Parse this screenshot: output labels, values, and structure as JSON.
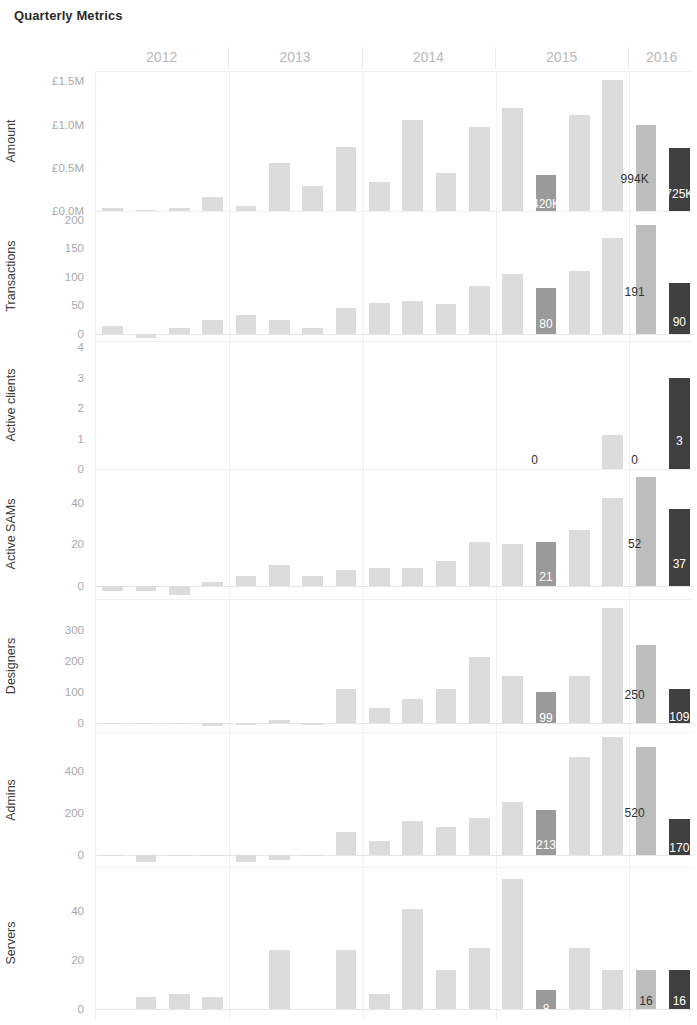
{
  "title": "Quarterly Metrics",
  "colors": {
    "bar_default": "#dcdcdc",
    "bar_mid": "#bdbdbd",
    "bar_highlight": "#9a9a9a",
    "bar_dark": "#3f3f3f",
    "grid": "#f0f0f0",
    "axis_text": "#a9a9a9",
    "year_text": "#b9b9b9",
    "title_text": "#2b2b2b"
  },
  "years": [
    {
      "label": "2012",
      "quarters": 4
    },
    {
      "label": "2013",
      "quarters": 4
    },
    {
      "label": "2014",
      "quarters": 4
    },
    {
      "label": "2015",
      "quarters": 4
    },
    {
      "label": "2016",
      "quarters": 2
    }
  ],
  "chart_data": {
    "type": "bar",
    "title": "Quarterly Metrics",
    "xlabel": "",
    "grid": true,
    "legend": "none",
    "orientation": "small-multiples-vertical",
    "x": [
      "2012 Q1",
      "2012 Q2",
      "2012 Q3",
      "2012 Q4",
      "2013 Q1",
      "2013 Q2",
      "2013 Q3",
      "2013 Q4",
      "2014 Q1",
      "2014 Q2",
      "2014 Q3",
      "2014 Q4",
      "2015 Q1",
      "2015 Q2",
      "2015 Q3",
      "2015 Q4",
      "2016 Q1",
      "2016 Q2"
    ],
    "panels": [
      {
        "name": "amount",
        "ylabel": "Amount",
        "ticks": [
          "£0.0M",
          "£0.5M",
          "£1.0M",
          "£1.5M"
        ],
        "tickvals": [
          0,
          500000,
          1000000,
          1500000
        ],
        "ylim": [
          0,
          1620000
        ],
        "values": [
          30000,
          8000,
          32000,
          160000,
          55000,
          560000,
          290000,
          740000,
          340000,
          1050000,
          440000,
          970000,
          1190000,
          420000,
          1110000,
          1520000,
          994000,
          725000
        ],
        "labels": {
          "13": "420K",
          "16": "994K",
          "17": "725K"
        },
        "label_style": {
          "13": "dark",
          "16": "outside",
          "17": "dark"
        }
      },
      {
        "name": "transactions",
        "ylabel": "Transactions",
        "ticks": [
          "0",
          "50",
          "100",
          "150",
          "200"
        ],
        "tickvals": [
          0,
          50,
          100,
          150,
          200
        ],
        "ylim": [
          -12,
          215
        ],
        "values": [
          14,
          -7,
          10,
          25,
          33,
          24,
          11,
          45,
          55,
          57,
          53,
          84,
          105,
          80,
          111,
          168,
          191,
          90
        ],
        "labels": {
          "13": "80",
          "16": "191",
          "17": "90"
        },
        "label_style": {
          "13": "dark",
          "16": "outside",
          "17": "dark"
        }
      },
      {
        "name": "active_clients",
        "ylabel": "Active clients",
        "ticks": [
          "0",
          "1",
          "2",
          "3",
          "4"
        ],
        "tickvals": [
          0,
          1,
          2,
          3,
          4
        ],
        "ylim": [
          0,
          4.2
        ],
        "values": [
          0,
          0,
          0,
          0,
          0,
          0,
          0,
          0,
          0,
          0,
          0,
          0,
          0,
          0,
          0,
          1.1,
          0,
          3
        ],
        "labels": {
          "13": "0",
          "16": "0",
          "17": "3"
        },
        "label_style": {
          "13": "outside",
          "16": "outside",
          "17": "dark"
        }
      },
      {
        "name": "active_sams",
        "ylabel": "Active SAMs",
        "ticks": [
          "0",
          "20",
          "40"
        ],
        "tickvals": [
          0,
          20,
          40
        ],
        "ylim": [
          -6,
          56
        ],
        "values": [
          -2,
          -2,
          -4,
          2,
          5,
          10,
          5,
          8,
          9,
          9,
          12,
          21,
          20,
          21,
          27,
          42,
          52,
          37
        ],
        "labels": {
          "13": "21",
          "16": "52",
          "17": "37"
        },
        "label_style": {
          "13": "dark",
          "16": "outside",
          "17": "dark"
        }
      },
      {
        "name": "designers",
        "ylabel": "Designers",
        "ticks": [
          "0",
          "100",
          "200",
          "300"
        ],
        "tickvals": [
          0,
          100,
          200,
          300
        ],
        "ylim": [
          -30,
          400
        ],
        "values": [
          -2,
          -2,
          -3,
          -12,
          -6,
          8,
          -7,
          108,
          46,
          76,
          110,
          212,
          152,
          99,
          150,
          370,
          250,
          109
        ],
        "labels": {
          "13": "99",
          "16": "250",
          "17": "109"
        },
        "label_style": {
          "13": "dark",
          "16": "outside",
          "17": "dark"
        }
      },
      {
        "name": "admins",
        "ylabel": "Admins",
        "ticks": [
          "0",
          "200",
          "400"
        ],
        "tickvals": [
          0,
          200,
          400
        ],
        "ylim": [
          -60,
          590
        ],
        "values": [
          -3,
          -38,
          -3,
          -4,
          -36,
          -26,
          -3,
          110,
          65,
          160,
          135,
          178,
          253,
          213,
          470,
          565,
          520,
          170
        ],
        "labels": {
          "13": "213",
          "16": "520",
          "17": "170"
        },
        "label_style": {
          "13": "dark",
          "16": "outside",
          "17": "dark"
        }
      },
      {
        "name": "servers",
        "ylabel": "Servers",
        "ticks": [
          "0",
          "20",
          "40"
        ],
        "tickvals": [
          0,
          20,
          40
        ],
        "ylim": [
          -4,
          58
        ],
        "values": [
          0,
          5,
          6,
          5,
          0,
          24,
          0,
          24,
          6,
          41,
          16,
          25,
          53,
          8,
          25,
          16,
          16,
          16
        ],
        "labels": {
          "13": "8",
          "16": "16",
          "17": "16"
        },
        "label_style": {
          "13": "dark",
          "16": "light",
          "17": "dark"
        }
      }
    ]
  }
}
